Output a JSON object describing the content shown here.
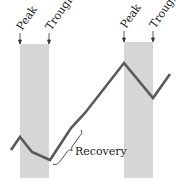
{
  "diagram": {
    "colors": {
      "background": "#ffffff",
      "shade": "#d6d6d6",
      "line": "#5a5a5a",
      "text": "#222222"
    },
    "recessions": [
      {
        "peak_label": "Peak",
        "trough_label": "Trough",
        "x_start": 20,
        "x_end": 49,
        "y_top": 44,
        "y_bottom": 178
      },
      {
        "peak_label": "Peak",
        "trough_label": "Trough",
        "x_start": 124,
        "x_end": 153,
        "y_top": 42,
        "y_bottom": 178
      }
    ],
    "line_points": [
      [
        11,
        150
      ],
      [
        20,
        137
      ],
      [
        32,
        152
      ],
      [
        50,
        160
      ],
      [
        71,
        128
      ],
      [
        85,
        113
      ],
      [
        124,
        63
      ],
      [
        153,
        98
      ],
      [
        170,
        74
      ]
    ],
    "annotation": {
      "label": "Recovery"
    }
  }
}
